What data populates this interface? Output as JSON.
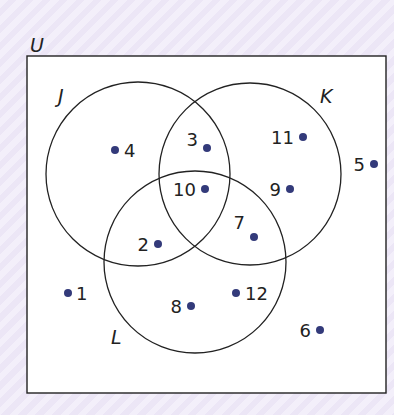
{
  "diagram": {
    "type": "venn",
    "universal_label": "U",
    "sets": [
      {
        "name": "J",
        "cx": 138,
        "cy": 174,
        "r": 92,
        "label_x": 58,
        "label_y": 103
      },
      {
        "name": "K",
        "cx": 250,
        "cy": 174,
        "r": 91,
        "label_x": 320,
        "label_y": 103
      },
      {
        "name": "L",
        "cx": 195,
        "cy": 262,
        "r": 91,
        "label_x": 111,
        "label_y": 344
      }
    ],
    "elements": [
      {
        "value": "1",
        "region": "none",
        "dot_x": 68,
        "dot_y": 293,
        "text_x": 76,
        "text_y": 300,
        "anchor": "start"
      },
      {
        "value": "2",
        "region": "J∩L",
        "dot_x": 158,
        "dot_y": 244,
        "text_x": 149,
        "text_y": 251,
        "anchor": "end"
      },
      {
        "value": "3",
        "region": "J∩K",
        "dot_x": 207,
        "dot_y": 148,
        "text_x": 198,
        "text_y": 146,
        "anchor": "end"
      },
      {
        "value": "4",
        "region": "J",
        "dot_x": 115,
        "dot_y": 150,
        "text_x": 124,
        "text_y": 157,
        "anchor": "start"
      },
      {
        "value": "5",
        "region": "none",
        "dot_x": 374,
        "dot_y": 164,
        "text_x": 365,
        "text_y": 171,
        "anchor": "end"
      },
      {
        "value": "6",
        "region": "none",
        "dot_x": 320,
        "dot_y": 330,
        "text_x": 311,
        "text_y": 337,
        "anchor": "end"
      },
      {
        "value": "7",
        "region": "K∩L",
        "dot_x": 254,
        "dot_y": 237,
        "text_x": 245,
        "text_y": 229,
        "anchor": "end"
      },
      {
        "value": "8",
        "region": "L",
        "dot_x": 191,
        "dot_y": 306,
        "text_x": 182,
        "text_y": 313,
        "anchor": "end"
      },
      {
        "value": "9",
        "region": "K",
        "dot_x": 290,
        "dot_y": 189,
        "text_x": 281,
        "text_y": 196,
        "anchor": "end"
      },
      {
        "value": "10",
        "region": "J∩K∩L",
        "dot_x": 205,
        "dot_y": 189,
        "text_x": 196,
        "text_y": 196,
        "anchor": "end"
      },
      {
        "value": "11",
        "region": "K",
        "dot_x": 303,
        "dot_y": 137,
        "text_x": 294,
        "text_y": 144,
        "anchor": "end"
      },
      {
        "value": "12",
        "region": "L",
        "dot_x": 236,
        "dot_y": 293,
        "text_x": 245,
        "text_y": 300,
        "anchor": "start"
      }
    ],
    "colors": {
      "dot": "#333a7a",
      "line": "#222222",
      "box_fill": "#ffffff"
    }
  }
}
